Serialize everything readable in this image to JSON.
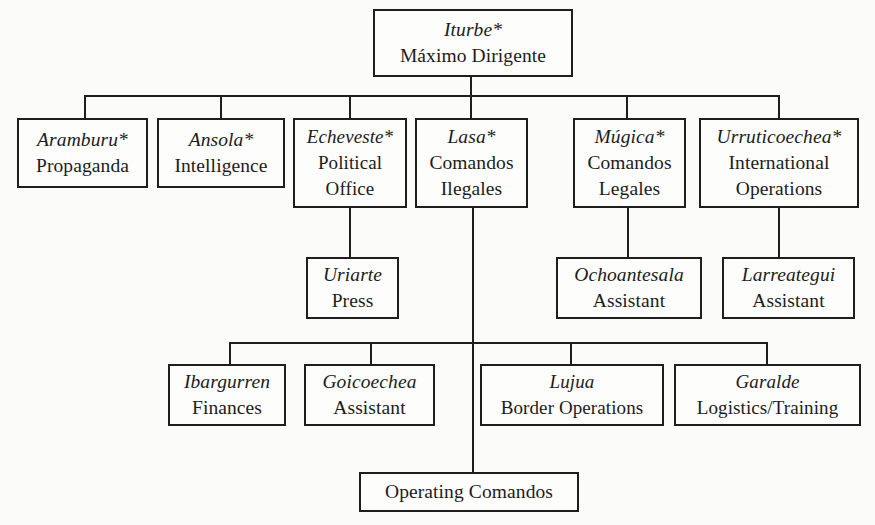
{
  "diagram": {
    "type": "organization-chart",
    "star_marker": "*",
    "root": {
      "name": "Iturbe*",
      "role": "Máximo Dirigente"
    },
    "level1": [
      {
        "name": "Aramburu*",
        "role": [
          "Propaganda"
        ]
      },
      {
        "name": "Ansola*",
        "role": [
          "Intelligence"
        ]
      },
      {
        "name": "Echeveste*",
        "role": [
          "Political",
          "Office"
        ]
      },
      {
        "name": "Lasa*",
        "role": [
          "Comandos",
          "Ilegales"
        ]
      },
      {
        "name": "Múgica*",
        "role": [
          "Comandos",
          "Legales"
        ]
      },
      {
        "name": "Urruticoechea*",
        "role": [
          "International",
          "Operations"
        ]
      }
    ],
    "level2": [
      {
        "name": "Uriarte",
        "role": "Press",
        "parent": "Echeveste*"
      },
      {
        "name": "Ochoantesala",
        "role": "Assistant",
        "parent": "Múgica*"
      },
      {
        "name": "Larreategui",
        "role": "Assistant",
        "parent": "Urruticoechea*"
      }
    ],
    "lasa_branch": [
      {
        "name": "Ibargurren",
        "role": "Finances"
      },
      {
        "name": "Goicoechea",
        "role": "Assistant"
      },
      {
        "name": "Lujua",
        "role": "Border Operations"
      },
      {
        "name": "Garalde",
        "role": "Logistics/Training"
      }
    ],
    "bottom": {
      "role": "Operating Comandos"
    }
  }
}
